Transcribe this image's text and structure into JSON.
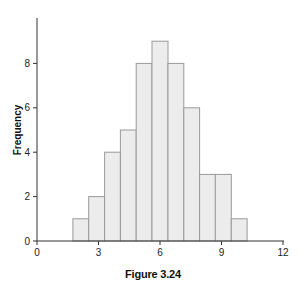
{
  "caption": "Figure 3.24",
  "chart_data": {
    "type": "bar",
    "subtype": "histogram",
    "title": "",
    "caption": "Figure 3.24",
    "xlabel": "",
    "ylabel": "Frequency",
    "xlim": [
      0,
      12
    ],
    "ylim": [
      0,
      10
    ],
    "xticks": [
      0,
      3,
      6,
      9,
      12
    ],
    "yticks": [
      0,
      2,
      4,
      6,
      8
    ],
    "grid": false,
    "legend": null,
    "bin_edges": [
      1.75,
      2.52,
      3.3,
      4.07,
      4.84,
      5.61,
      6.39,
      7.16,
      7.93,
      8.7,
      9.48,
      10.25
    ],
    "values": [
      1,
      2,
      4,
      5,
      8,
      9,
      8,
      6,
      3,
      3,
      1
    ],
    "colors": {
      "bar_fill": "#ececec",
      "bar_stroke": "#9a9a9a",
      "axis": "#333333"
    }
  }
}
